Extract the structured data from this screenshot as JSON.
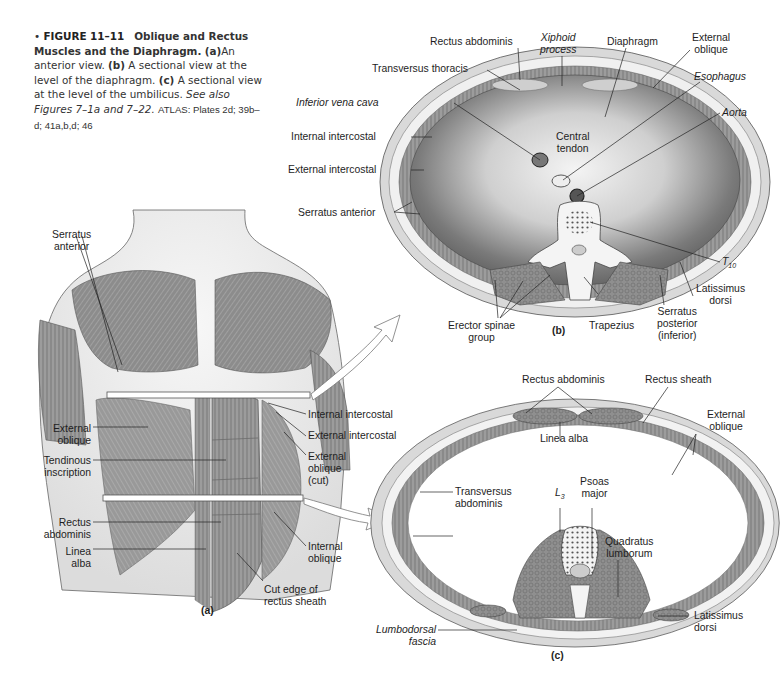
{
  "caption": {
    "bullet": "•",
    "figure_number": "FIGURE 11–11",
    "title": "Oblique and Rectus Muscles and the Diaphragm.",
    "part_a_marker": "(a)",
    "part_a_text": "An anterior view.",
    "part_b_marker": "(b)",
    "part_b_text": "A sectional view at the level of the diaphragm.",
    "part_c_marker": "(c)",
    "part_c_text": "A sectional view at the level of the umbilicus.",
    "see_also": "See also Figures 7–1a and 7–22.",
    "atlas": "ATLAS: Plates 2d; 39b–d; 41a,b,d; 46"
  },
  "panel_a": {
    "label": "(a)",
    "labels": {
      "serratus_anterior": [
        "Serratus",
        "anterior"
      ],
      "external_oblique": [
        "External",
        "oblique"
      ],
      "tendinous_inscription": [
        "Tendinous",
        "inscription"
      ],
      "rectus_abdominis": [
        "Rectus",
        "abdominis"
      ],
      "linea_alba": [
        "Linea",
        "alba"
      ],
      "internal_intercostal": "Internal intercostal",
      "external_intercostal": "External intercostal",
      "external_oblique_cut": [
        "External",
        "oblique",
        "(cut)"
      ],
      "internal_oblique": [
        "Internal",
        "oblique"
      ],
      "cut_edge": [
        "Cut edge of",
        "rectus sheath"
      ]
    }
  },
  "panel_b": {
    "label": "(b)",
    "labels": {
      "rectus_abdominis": "Rectus abdominis",
      "xiphoid_process": [
        "Xiphoid",
        "process"
      ],
      "diaphragm": "Diaphragm",
      "external_oblique": [
        "External",
        "oblique"
      ],
      "transversus_thoracis": "Transversus thoracis",
      "esophagus": "Esophagus",
      "inferior_vena_cava": "Inferior vena cava",
      "aorta": "Aorta",
      "internal_intercostal": "Internal intercostal",
      "central_tendon": [
        "Central",
        "tendon"
      ],
      "external_intercostal": "External intercostal",
      "serratus_anterior": "Serratus anterior",
      "t10": "T",
      "t10_sub": "10",
      "latissimus_dorsi": [
        "Latissimus",
        "dorsi"
      ],
      "erector_spinae": [
        "Erector spinae",
        "group"
      ],
      "trapezius": "Trapezius",
      "serratus_posterior": [
        "Serratus",
        "posterior",
        "(inferior)"
      ]
    }
  },
  "panel_c": {
    "label": "(c)",
    "labels": {
      "rectus_abdominis": "Rectus abdominis",
      "rectus_sheath": "Rectus sheath",
      "external_oblique": [
        "External",
        "oblique"
      ],
      "linea_alba": "Linea alba",
      "transversus_abdominis": [
        "Transversus",
        "abdominis"
      ],
      "l3": "L",
      "l3_sub": "3",
      "psoas_major": [
        "Psoas",
        "major"
      ],
      "quadratus_lumborum": [
        "Quadratus",
        "lumborum"
      ],
      "lumbodorsal_fascia": [
        "Lumbodorsal",
        "fascia"
      ],
      "latissimus_dorsi": [
        "Latissimus",
        "dorsi"
      ]
    }
  },
  "colors": {
    "background": "#ffffff",
    "muscle": "#8a8a8a",
    "muscle_dark": "#5f5f5f",
    "skin": "#e6e6e6",
    "tendon": "#f2f2f2",
    "text": "#1e1e1e"
  }
}
